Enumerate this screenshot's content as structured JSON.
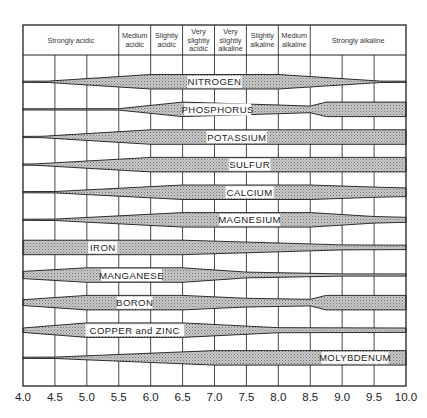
{
  "chart_data": {
    "type": "band",
    "title": "",
    "xlabel": "pH",
    "ylabel": "",
    "xlim": [
      4.0,
      10.0
    ],
    "x_ticks": [
      "4.0",
      "4.5",
      "5.0",
      "5.5",
      "6.0",
      "6.5",
      "7.0",
      "7.5",
      "8.0",
      "8.5",
      "9.0",
      "9.5",
      "10.0"
    ],
    "grid": true,
    "header_zones": [
      {
        "label": [
          "Strongly acidic"
        ],
        "from": 4.0,
        "to": 5.5
      },
      {
        "label": [
          "Medium",
          "acidic"
        ],
        "from": 5.5,
        "to": 6.0
      },
      {
        "label": [
          "Slightly",
          "acidic"
        ],
        "from": 6.0,
        "to": 6.5
      },
      {
        "label": [
          "Very",
          "slightly",
          "acidic"
        ],
        "from": 6.5,
        "to": 7.0
      },
      {
        "label": [
          "Very",
          "slightly",
          "alkaline"
        ],
        "from": 7.0,
        "to": 7.5
      },
      {
        "label": [
          "Slightly",
          "alkaline"
        ],
        "from": 7.5,
        "to": 8.0
      },
      {
        "label": [
          "Medium",
          "alkaline"
        ],
        "from": 8.0,
        "to": 8.5
      },
      {
        "label": [
          "Strongly alkaline"
        ],
        "from": 8.5,
        "to": 10.0
      }
    ],
    "series": [
      {
        "name": "NITROGEN",
        "label_at": 7.0,
        "profile": [
          [
            4.0,
            0.05
          ],
          [
            4.4,
            0.1
          ],
          [
            6.0,
            1
          ],
          [
            8.0,
            1
          ],
          [
            9.6,
            0.1
          ],
          [
            10.0,
            0.05
          ]
        ]
      },
      {
        "name": "PHOSPHORUS",
        "label_at": 7.05,
        "profile": [
          [
            4.0,
            0.08
          ],
          [
            5.5,
            0.1
          ],
          [
            6.5,
            1
          ],
          [
            8.0,
            0.6
          ],
          [
            8.5,
            0.45
          ],
          [
            8.75,
            1
          ],
          [
            10.0,
            1
          ]
        ]
      },
      {
        "name": "POTASSIUM",
        "label_at": 7.35,
        "profile": [
          [
            4.0,
            0.05
          ],
          [
            4.3,
            0.1
          ],
          [
            6.0,
            1
          ],
          [
            10.0,
            1
          ]
        ]
      },
      {
        "name": "SULFUR",
        "label_at": 7.55,
        "profile": [
          [
            4.0,
            0.05
          ],
          [
            4.2,
            0.1
          ],
          [
            6.0,
            1
          ],
          [
            10.0,
            1
          ]
        ]
      },
      {
        "name": "CALCIUM",
        "label_at": 7.55,
        "profile": [
          [
            4.0,
            0.05
          ],
          [
            4.5,
            0.1
          ],
          [
            6.5,
            1
          ],
          [
            8.5,
            1
          ],
          [
            9.5,
            0.7
          ],
          [
            10.0,
            0.6
          ]
        ]
      },
      {
        "name": "MAGNESIUM",
        "label_at": 7.55,
        "profile": [
          [
            4.0,
            0.05
          ],
          [
            4.5,
            0.1
          ],
          [
            6.5,
            1
          ],
          [
            8.5,
            1
          ],
          [
            9.5,
            0.45
          ],
          [
            10.0,
            0.35
          ]
        ]
      },
      {
        "name": "IRON",
        "label_at": 5.25,
        "profile": [
          [
            4.0,
            1
          ],
          [
            6.5,
            1
          ],
          [
            9.0,
            0.35
          ],
          [
            10.0,
            0.3
          ]
        ]
      },
      {
        "name": "MANGANESE",
        "label_at": 5.7,
        "profile": [
          [
            4.0,
            0.5
          ],
          [
            5.0,
            1
          ],
          [
            6.5,
            1
          ],
          [
            7.5,
            0.4
          ],
          [
            9.0,
            0.15
          ],
          [
            10.0,
            0.15
          ]
        ]
      },
      {
        "name": "BORON",
        "label_at": 5.75,
        "profile": [
          [
            4.0,
            0.4
          ],
          [
            5.0,
            1
          ],
          [
            6.5,
            1
          ],
          [
            7.5,
            0.6
          ],
          [
            8.5,
            0.45
          ],
          [
            8.75,
            1
          ],
          [
            10.0,
            1
          ]
        ]
      },
      {
        "name": "COPPER and ZINC",
        "label_at": 5.75,
        "profile": [
          [
            4.0,
            0.3
          ],
          [
            5.0,
            1
          ],
          [
            6.5,
            1
          ],
          [
            8.0,
            0.35
          ],
          [
            10.0,
            0.3
          ]
        ]
      },
      {
        "name": "MOLYBDENUM",
        "label_at": 9.2,
        "profile": [
          [
            4.0,
            0.05
          ],
          [
            4.5,
            0.1
          ],
          [
            7.0,
            1
          ],
          [
            10.0,
            1
          ]
        ]
      }
    ]
  },
  "labels": {
    "header_strongly_acidic": "Strongly acidic",
    "header_strongly_alkaline": "Strongly alkaline"
  }
}
